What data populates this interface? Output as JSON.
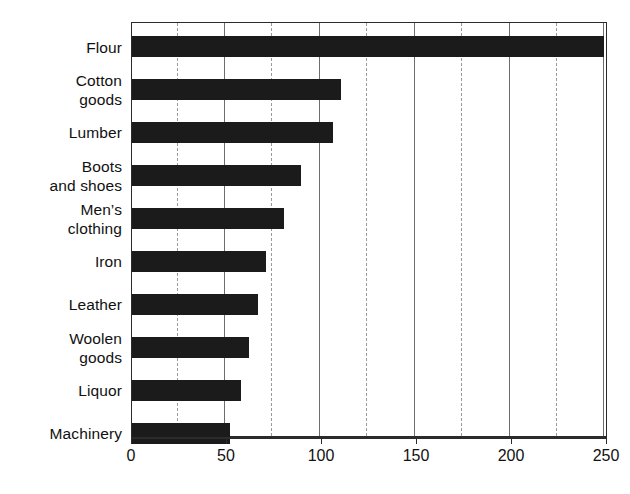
{
  "chart_data": {
    "type": "bar",
    "orientation": "horizontal",
    "title": "",
    "subtitle": "",
    "xlabel": "",
    "ylabel": "",
    "categories": [
      "Flour",
      "Cotton\ngoods",
      "Lumber",
      "Boots\nand shoes",
      "Men’s\nclothing",
      "Iron",
      "Leather",
      "Woolen\ngoods",
      "Liquor",
      "Machinery"
    ],
    "values": [
      251,
      111,
      107,
      90,
      81,
      71,
      67,
      62,
      58,
      52
    ],
    "xlim": [
      0,
      252
    ],
    "x_tick_values": [
      0,
      50,
      100,
      150,
      200,
      250
    ],
    "x_tick_labels": [
      "0",
      "50",
      "100",
      "150",
      "200",
      "250"
    ],
    "x_minor_tick_values": [
      25,
      75,
      125,
      175,
      225
    ],
    "grid": true,
    "grid_axis": "x",
    "legend": false,
    "bar_color": "#1b1b1b",
    "frame_color": "#2b2b2b",
    "gridline_color": "#8a8a8a",
    "background_color": "#ffffff"
  }
}
